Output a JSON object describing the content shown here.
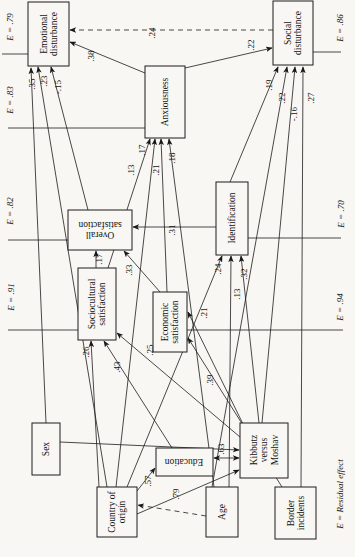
{
  "figure": {
    "note": "E = Residual effect",
    "boxes": [
      {
        "id": "emotional-disturbance",
        "label": "Emotional disturbance",
        "residual": "E = .79"
      },
      {
        "id": "social-disturbance",
        "label": "Social disturbance",
        "residual": "E = .86"
      },
      {
        "id": "anxiousness",
        "label": "Anxiousness",
        "residual": "E = .83"
      },
      {
        "id": "overall-satisfaction",
        "label": "Overall satisfaction",
        "residual": "E = .82"
      },
      {
        "id": "identification",
        "label": "Identification",
        "residual": "E = .70"
      },
      {
        "id": "sociocultural-satisfaction",
        "label": "Sociocultural satisfaction",
        "residual": "E = .91"
      },
      {
        "id": "economic-satisfaction",
        "label": "Economic satisfaction",
        "residual": "E = .94"
      },
      {
        "id": "sex",
        "label": "Sex"
      },
      {
        "id": "education",
        "label": "Education"
      },
      {
        "id": "kibbutz-versus-moshav",
        "label": "Kibbutz versus Moshav"
      },
      {
        "id": "country-of-origin",
        "label": "Country of origin"
      },
      {
        "id": "age",
        "label": "Age"
      },
      {
        "id": "border-incidents",
        "label": "Border incidents"
      }
    ],
    "paths": [
      {
        "from": "sex",
        "to": "emotional-disturbance",
        "coef": ".35",
        "style": "solid"
      },
      {
        "from": "country-of-origin",
        "to": "emotional-disturbance",
        "coef": ".23",
        "style": "solid"
      },
      {
        "from": "overall-satisfaction",
        "to": "emotional-disturbance",
        "coef": "-.15",
        "style": "solid"
      },
      {
        "from": "anxiousness",
        "to": "emotional-disturbance",
        "coef": ".38",
        "style": "solid"
      },
      {
        "from": "social-disturbance",
        "to": "emotional-disturbance",
        "coef": ".24",
        "style": "dashed"
      },
      {
        "from": "anxiousness",
        "to": "social-disturbance",
        "coef": ".22",
        "style": "solid"
      },
      {
        "from": "identification",
        "to": "social-disturbance",
        "coef": ".19",
        "style": "solid"
      },
      {
        "from": "age",
        "to": "social-disturbance",
        "coef": ".22",
        "style": "solid"
      },
      {
        "from": "kibbutz-versus-moshav",
        "to": "social-disturbance",
        "coef": "-.16",
        "style": "solid"
      },
      {
        "from": "border-incidents",
        "to": "social-disturbance",
        "coef": ".27",
        "style": "solid"
      },
      {
        "from": "sociocultural-satisfaction",
        "to": "anxiousness",
        "coef": ".13",
        "style": "solid"
      },
      {
        "from": "country-of-origin",
        "to": "anxiousness",
        "coef": ".17",
        "style": "solid"
      },
      {
        "from": "economic-satisfaction",
        "to": "anxiousness",
        "coef": ".21",
        "style": "solid"
      },
      {
        "from": "age",
        "to": "anxiousness",
        "coef": ".18",
        "style": "solid"
      },
      {
        "from": "sociocultural-satisfaction",
        "to": "overall-satisfaction",
        "coef": ".17",
        "style": "solid"
      },
      {
        "from": "economic-satisfaction",
        "to": "overall-satisfaction",
        "coef": ".33",
        "style": "solid"
      },
      {
        "from": "identification",
        "to": "overall-satisfaction",
        "coef": ".31",
        "style": "solid"
      },
      {
        "from": "country-of-origin",
        "to": "sociocultural-satisfaction",
        "coef": ".26",
        "style": "solid"
      },
      {
        "from": "education",
        "to": "sociocultural-satisfaction",
        "coef": ".43",
        "style": "solid"
      },
      {
        "from": "kibbutz-versus-moshav",
        "to": "sociocultural-satisfaction",
        "coef": ".25",
        "style": "solid"
      },
      {
        "from": "kibbutz-versus-moshav",
        "to": "economic-satisfaction",
        "coef": ".21",
        "style": "solid"
      },
      {
        "from": "border-incidents",
        "to": "economic-satisfaction",
        "coef": ".39",
        "style": "solid"
      },
      {
        "from": "country-of-origin",
        "to": "identification",
        "coef": ".24",
        "style": "solid"
      },
      {
        "from": "age",
        "to": "identification",
        "coef": ".13",
        "style": "solid"
      },
      {
        "from": "kibbutz-versus-moshav",
        "to": "identification",
        "coef": ".32",
        "style": "solid"
      },
      {
        "from": "country-of-origin",
        "to": "education",
        "coef": ".57",
        "style": "solid"
      },
      {
        "from": "education",
        "to": "kibbutz-versus-moshav",
        "coef": ".63",
        "style": "double"
      },
      {
        "from": "age",
        "to": "country-of-origin",
        "coef": ".79",
        "style": "dashed"
      },
      {
        "from": "sex",
        "to": "kibbutz-versus-moshav",
        "coef": "",
        "style": "solid"
      },
      {
        "from": "country-of-origin",
        "to": "kibbutz-versus-moshav",
        "coef": "",
        "style": "solid"
      }
    ]
  }
}
